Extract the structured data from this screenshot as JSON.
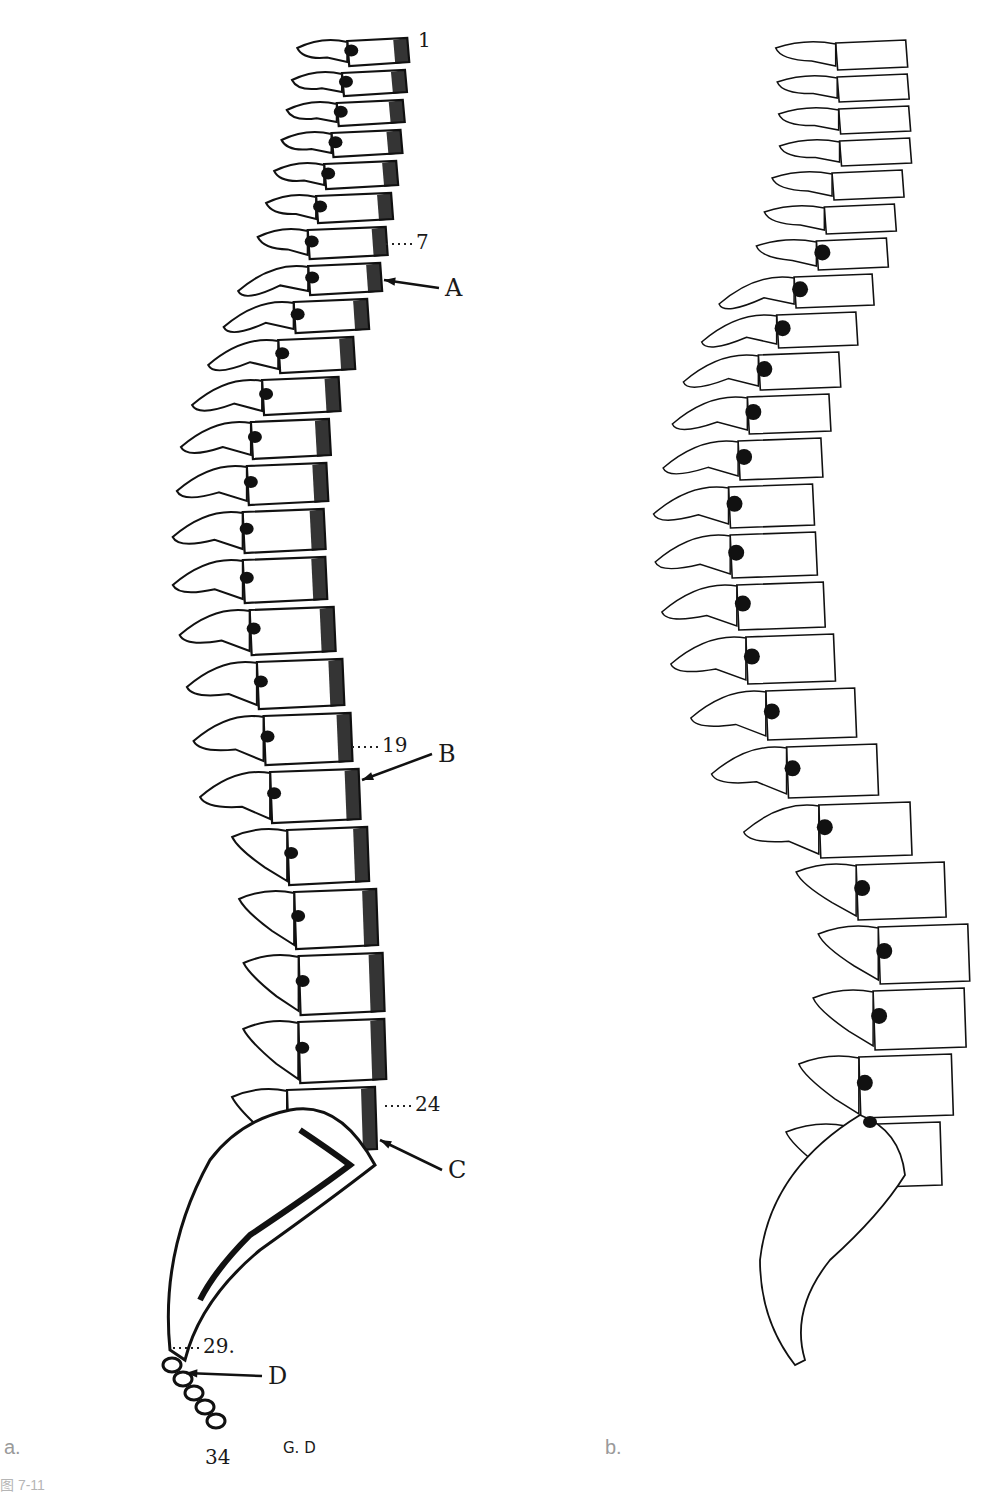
{
  "figure": {
    "panel_a_label": "a.",
    "panel_b_label": "b.",
    "caption_partial": "图 7-11",
    "signature": "G. D"
  },
  "panel_a": {
    "title": "Spine lateral view, shaded engraving",
    "labels": [
      {
        "id": "num-1",
        "text": "1",
        "x": 418,
        "y": 30,
        "kind": "number"
      },
      {
        "id": "num-7",
        "text": "7",
        "x": 416,
        "y": 232,
        "kind": "number",
        "leader": "dotted"
      },
      {
        "id": "letter-A",
        "text": "A",
        "x": 445,
        "y": 276,
        "kind": "letter",
        "arrow_to": [
          384,
          280
        ]
      },
      {
        "id": "num-19",
        "text": "19",
        "x": 382,
        "y": 735,
        "kind": "number",
        "leader": "dotted"
      },
      {
        "id": "letter-B",
        "text": "B",
        "x": 438,
        "y": 742,
        "kind": "letter",
        "arrow_to": [
          362,
          780
        ]
      },
      {
        "id": "num-24",
        "text": "24",
        "x": 415,
        "y": 1094,
        "kind": "number",
        "leader": "dotted"
      },
      {
        "id": "letter-C",
        "text": "C",
        "x": 448,
        "y": 1158,
        "kind": "letter",
        "arrow_to": [
          380,
          1140
        ]
      },
      {
        "id": "num-29",
        "text": "29.",
        "x": 203,
        "y": 1336,
        "kind": "number",
        "leader": "dotted"
      },
      {
        "id": "letter-D",
        "text": "D",
        "x": 268,
        "y": 1364,
        "kind": "letter",
        "arrow_to": [
          186,
          1373
        ]
      },
      {
        "id": "num-34",
        "text": "34",
        "x": 205,
        "y": 1447,
        "kind": "number"
      },
      {
        "id": "signature",
        "text": "G. D",
        "x": 283,
        "y": 1441,
        "kind": "small"
      }
    ]
  },
  "panel_b": {
    "title": "Spine lateral view, outline drawing"
  },
  "colors": {
    "ink": "#111111",
    "paper": "#ffffff",
    "panel_label": "#9a9a9a"
  }
}
